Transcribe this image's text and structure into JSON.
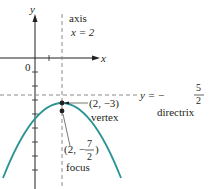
{
  "diagram": {
    "type": "parabola",
    "equation_context": "parabola opening downward",
    "axes": {
      "x_label": "x",
      "y_label": "y",
      "origin_label": "0"
    },
    "axis_of_symmetry": {
      "label_line1": "axis",
      "label_line2": "x = 2"
    },
    "directrix": {
      "label_prefix": "y = −",
      "numerator": "5",
      "denominator": "2",
      "name": "directrix"
    },
    "vertex": {
      "coords": "(2, −3)",
      "name": "vertex"
    },
    "focus": {
      "coords_prefix": "(2, −",
      "numerator": "7",
      "denominator": "2",
      "coords_suffix": ")",
      "name": "focus"
    },
    "colors": {
      "curve": "#2a9494",
      "ink": "#231f20",
      "dashed": "#8a8a8a"
    }
  }
}
